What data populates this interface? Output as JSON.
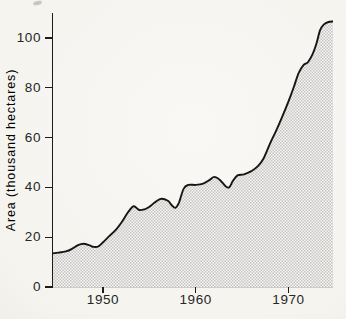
{
  "chart_data": {
    "type": "area",
    "title": "",
    "xlabel": "",
    "ylabel": "Area (thousand hectares)",
    "xlim": [
      1944.5,
      1974.8
    ],
    "ylim": [
      0,
      110
    ],
    "x_ticks": [
      1950,
      1960,
      1970
    ],
    "x_tick_labels": [
      "1950",
      "1960",
      "1970"
    ],
    "y_ticks": [
      0,
      20,
      40,
      60,
      80,
      100
    ],
    "y_tick_labels": [
      "0",
      "20",
      "40",
      "60",
      "80",
      "100"
    ],
    "grid": false,
    "legend": false,
    "series": [
      {
        "name": "area-thousand-hectares",
        "x": [
          1944.5,
          1945.2,
          1946.0,
          1946.6,
          1947.3,
          1947.9,
          1948.5,
          1949.0,
          1949.5,
          1950.0,
          1950.7,
          1951.4,
          1952.1,
          1952.7,
          1953.3,
          1953.9,
          1954.5,
          1955.0,
          1955.7,
          1956.3,
          1957.0,
          1957.4,
          1957.8,
          1958.2,
          1958.7,
          1959.2,
          1960.0,
          1960.8,
          1961.5,
          1962.0,
          1962.6,
          1963.2,
          1963.6,
          1964.0,
          1964.5,
          1965.2,
          1966.0,
          1966.7,
          1967.3,
          1968.0,
          1968.7,
          1969.4,
          1970.0,
          1970.6,
          1971.1,
          1971.6,
          1972.1,
          1972.6,
          1973.0,
          1973.4,
          1973.8,
          1974.3,
          1974.8
        ],
        "y": [
          13.5,
          13.8,
          14.3,
          15.2,
          16.8,
          17.4,
          16.8,
          16.1,
          16.3,
          18.0,
          20.5,
          23.0,
          26.5,
          30.0,
          32.4,
          30.9,
          31.2,
          32.2,
          34.3,
          35.4,
          34.6,
          32.9,
          31.8,
          34.0,
          39.5,
          41.0,
          41.0,
          41.5,
          43.0,
          44.2,
          43.0,
          40.5,
          40.0,
          42.5,
          44.8,
          45.2,
          46.5,
          48.5,
          51.5,
          57.5,
          63.0,
          69.0,
          74.5,
          80.5,
          86.0,
          89.0,
          90.3,
          93.5,
          97.5,
          103.0,
          105.3,
          106.4,
          106.6
        ]
      }
    ],
    "styles": {
      "line_color": "#161616",
      "axis_color": "#1c1c1c",
      "text_color": "#262626",
      "background": "#f7f6f2",
      "fill_pattern": "halftone-checker",
      "fill_pattern_colors": [
        "#c6c6c6",
        "#f6f5f1"
      ]
    }
  }
}
